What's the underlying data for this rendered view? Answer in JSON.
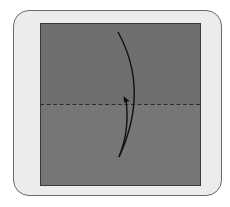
{
  "diagram": {
    "type": "origami-fold-step",
    "frame": {
      "background": "#ececec",
      "border": "#6a6a6a"
    },
    "paper": {
      "top_half_color": "#6f6f6f",
      "bottom_half_color": "#767676",
      "edge_color": "#3a3a3a"
    },
    "fold_line": {
      "style": "dashed",
      "kind": "valley-fold",
      "color": "#2a2a2a"
    },
    "arrow": {
      "kind": "fold-up-arrow",
      "color": "#111111"
    }
  }
}
